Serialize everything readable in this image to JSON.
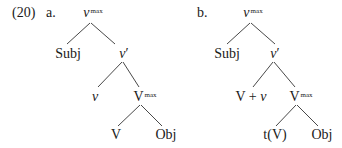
{
  "example": {
    "number": "(20)",
    "trees": [
      {
        "label": "a.",
        "nodes": {
          "root": {
            "base": "v",
            "sup": "max"
          },
          "subj": "Subj",
          "vbar": {
            "base": "v",
            "prime": "′"
          },
          "little_v": "v",
          "vmax": {
            "base": "V",
            "sup": "max"
          },
          "verb": "V",
          "obj": "Obj"
        }
      },
      {
        "label": "b.",
        "nodes": {
          "root": {
            "base": "v",
            "sup": "max"
          },
          "subj": "Subj",
          "vbar": {
            "base": "v",
            "prime": "′"
          },
          "complex_head": {
            "v1": "V",
            "plus": " + ",
            "v2": "v"
          },
          "vmax": {
            "base": "V",
            "sup": "max"
          },
          "trace": "t(V)",
          "obj": "Obj"
        }
      }
    ]
  }
}
